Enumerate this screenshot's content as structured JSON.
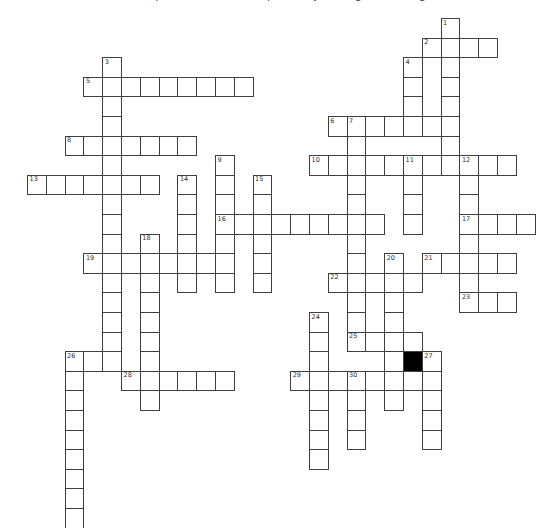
{
  "header": {
    "clipped_text": "Complete the crossword puzzle by solving the clues given below"
  },
  "grid": {
    "origin_x": 27,
    "origin_y": 18,
    "cell_w": 18.8,
    "cell_h": 19.6,
    "line_color": "#3f3f3f",
    "number_color": "#2e2e2e",
    "background_color": "#ffffff",
    "black_cell_color": "#000000",
    "black_cells": [
      {
        "col": 20,
        "row": 17
      }
    ],
    "words": [
      {
        "number": 1,
        "dir": "down",
        "col": 22,
        "row": 0,
        "len": 8
      },
      {
        "number": 2,
        "dir": "across",
        "col": 21,
        "row": 1,
        "len": 4
      },
      {
        "number": 3,
        "dir": "down",
        "col": 4,
        "row": 2,
        "len": 16
      },
      {
        "number": 4,
        "dir": "down",
        "col": 20,
        "row": 2,
        "len": 4
      },
      {
        "number": 5,
        "dir": "across",
        "col": 3,
        "row": 3,
        "len": 9
      },
      {
        "number": 6,
        "dir": "across",
        "col": 16,
        "row": 5,
        "len": 7
      },
      {
        "number": 7,
        "dir": "down",
        "col": 17,
        "row": 5,
        "len": 12
      },
      {
        "number": 8,
        "dir": "across",
        "col": 2,
        "row": 6,
        "len": 7
      },
      {
        "number": 9,
        "dir": "down",
        "col": 10,
        "row": 7,
        "len": 7
      },
      {
        "number": 10,
        "dir": "across",
        "col": 15,
        "row": 7,
        "len": 11
      },
      {
        "number": 11,
        "dir": "down",
        "col": 20,
        "row": 7,
        "len": 4
      },
      {
        "number": 12,
        "dir": "down",
        "col": 23,
        "row": 7,
        "len": 8
      },
      {
        "number": 13,
        "dir": "across",
        "col": 0,
        "row": 8,
        "len": 7
      },
      {
        "number": 14,
        "dir": "down",
        "col": 8,
        "row": 8,
        "len": 6
      },
      {
        "number": 15,
        "dir": "down",
        "col": 12,
        "row": 8,
        "len": 6
      },
      {
        "number": 16,
        "dir": "across",
        "col": 10,
        "row": 10,
        "len": 9
      },
      {
        "number": 17,
        "dir": "across",
        "col": 23,
        "row": 10,
        "len": 4
      },
      {
        "number": 18,
        "dir": "down",
        "col": 6,
        "row": 11,
        "len": 9
      },
      {
        "number": 19,
        "dir": "across",
        "col": 3,
        "row": 12,
        "len": 8
      },
      {
        "number": 20,
        "dir": "down",
        "col": 19,
        "row": 12,
        "len": 8
      },
      {
        "number": 21,
        "dir": "across",
        "col": 21,
        "row": 12,
        "len": 5
      },
      {
        "number": 22,
        "dir": "across",
        "col": 16,
        "row": 13,
        "len": 5
      },
      {
        "number": 23,
        "dir": "across",
        "col": 23,
        "row": 14,
        "len": 3
      },
      {
        "number": 24,
        "dir": "down",
        "col": 15,
        "row": 15,
        "len": 8
      },
      {
        "number": 25,
        "dir": "across",
        "col": 17,
        "row": 16,
        "len": 4
      },
      {
        "number": 26,
        "dir": "across",
        "col": 2,
        "row": 17,
        "len": 3
      },
      {
        "number": 26,
        "dir": "down",
        "col": 2,
        "row": 17,
        "len": 9
      },
      {
        "number": 27,
        "dir": "down",
        "col": 21,
        "row": 17,
        "len": 5
      },
      {
        "number": 28,
        "dir": "across",
        "col": 5,
        "row": 18,
        "len": 6
      },
      {
        "number": 29,
        "dir": "across",
        "col": 14,
        "row": 18,
        "len": 8
      },
      {
        "number": 30,
        "dir": "down",
        "col": 17,
        "row": 18,
        "len": 4
      }
    ]
  }
}
